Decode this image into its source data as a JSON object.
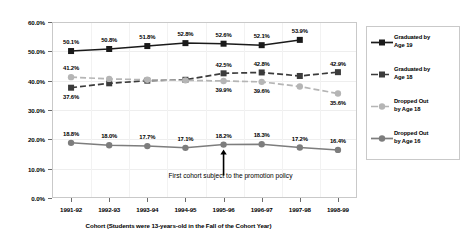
{
  "chart_data": {
    "type": "line",
    "title": "",
    "xlabel": "Cohort (Students were 13-years-old in the Fall of the Cohort Year)",
    "ylabel": "",
    "ylim": [
      0,
      60
    ],
    "ytick_labels": [
      "60.0%",
      "50.0%",
      "40.0%",
      "30.0%",
      "20.0%",
      "10.0%",
      "0.0%"
    ],
    "ytick_values": [
      60,
      50,
      40,
      30,
      20,
      10,
      0
    ],
    "grid": false,
    "legend_position": "right",
    "categories": [
      "1991-92",
      "1992-93",
      "1993-94",
      "1994-95",
      "1995-96",
      "1996-97",
      "1997-98",
      "1998-99"
    ],
    "series": [
      {
        "name": "Graduated by Age 19",
        "color": "#1a1a1a",
        "marker": "square",
        "line": "solid",
        "values": [
          50.1,
          50.8,
          51.8,
          52.8,
          52.6,
          52.1,
          53.9,
          null
        ],
        "labels": [
          "50.1%",
          "50.8%",
          "51.8%",
          "52.8%",
          "52.6%",
          "52.1%",
          "53.9%",
          ""
        ]
      },
      {
        "name": "Graduated by Age 18",
        "color": "#3b3b3b",
        "marker": "square",
        "line": "dashed",
        "values": [
          37.6,
          39.1,
          40.0,
          40.3,
          42.5,
          42.8,
          41.6,
          42.9
        ],
        "labels": [
          "37.6%",
          "",
          "",
          "",
          "42.5%",
          "42.8%",
          "",
          "42.9%"
        ]
      },
      {
        "name": "Dropped Out by Age 18",
        "color": "#b5b5b5",
        "marker": "circle",
        "line": "dashed",
        "values": [
          41.2,
          40.6,
          40.3,
          40.1,
          39.9,
          39.6,
          38.0,
          35.6
        ],
        "labels": [
          "41.2%",
          "",
          "",
          "",
          "39.9%",
          "39.6%",
          "",
          "35.6%"
        ]
      },
      {
        "name": "Dropped Out by Age 16",
        "color": "#7d7d7d",
        "marker": "circle",
        "line": "solid",
        "values": [
          18.8,
          18.0,
          17.7,
          17.1,
          18.2,
          18.3,
          17.2,
          16.4
        ],
        "labels": [
          "18.8%",
          "18.0%",
          "17.7%",
          "17.1%",
          "18.2%",
          "18.3%",
          "17.2%",
          "16.4%"
        ]
      }
    ],
    "annotations": [
      {
        "text": "First cohort subject to\nthe promotion policy",
        "target_category": "1995-96",
        "target_series": "Dropped Out by Age 16"
      }
    ]
  },
  "legend": {
    "items": [
      {
        "label": "Graduated by\nAge 19"
      },
      {
        "label": "Graduated by\nAge 18"
      },
      {
        "label": "Dropped Out\nby Age 18"
      },
      {
        "label": "Dropped Out\nby Age 16"
      }
    ]
  }
}
